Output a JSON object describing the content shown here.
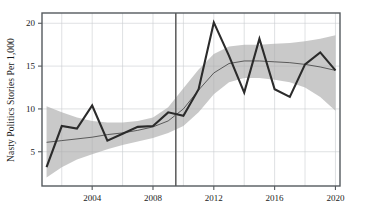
{
  "chart_data": {
    "type": "line",
    "title": "",
    "xlabel": "",
    "ylabel": "Nasty Politics Stories Per 1,000",
    "xlim": [
      2000.7,
      2020.3
    ],
    "ylim": [
      1.0,
      21.2
    ],
    "grid": true,
    "legend": "none",
    "x_ticks": [
      2004,
      2008,
      2012,
      2016,
      2020
    ],
    "x_tick_labels": [
      "2004",
      "2008",
      "2012",
      "2016",
      "2020"
    ],
    "y_ticks": [
      5,
      10,
      15,
      20
    ],
    "y_tick_labels": [
      "5",
      "10",
      "15",
      "20"
    ],
    "x_gridlines": [
      2002,
      2004,
      2006,
      2008,
      2010,
      2012,
      2014,
      2016,
      2018,
      2020
    ],
    "y_gridlines": [
      5,
      10,
      15,
      20
    ],
    "annotations": [
      {
        "name": "vertical-reference-line",
        "type": "vline",
        "x": 2009.5
      }
    ],
    "x": [
      2001,
      2002,
      2003,
      2004,
      2005,
      2006,
      2007,
      2008,
      2009,
      2010,
      2011,
      2012,
      2013,
      2014,
      2015,
      2016,
      2017,
      2018,
      2019,
      2020
    ],
    "series": [
      {
        "name": "Nasty Politics Stories Per 1,000",
        "style": "observed-line",
        "color": "#2b2b2b",
        "values": [
          3.2,
          8.0,
          7.7,
          10.4,
          6.3,
          7.1,
          7.9,
          8.0,
          9.6,
          9.2,
          12.3,
          20.1,
          16.2,
          11.9,
          18.2,
          12.3,
          11.4,
          15.2,
          16.6,
          14.5
        ]
      },
      {
        "name": "Smoothed trend",
        "style": "trend-line",
        "color": "#3d3d3d",
        "values": [
          6.1,
          6.3,
          6.5,
          6.7,
          7.0,
          7.2,
          7.5,
          7.9,
          8.6,
          10.0,
          12.2,
          14.2,
          15.3,
          15.6,
          15.6,
          15.5,
          15.4,
          15.2,
          14.9,
          14.5
        ]
      }
    ],
    "confidence_band": {
      "name": "confidence-interval",
      "color": "#a8a8a8",
      "opacity": 0.62,
      "upper": [
        10.3,
        9.6,
        9.0,
        8.6,
        8.4,
        8.4,
        8.6,
        9.0,
        10.2,
        12.4,
        14.6,
        16.4,
        17.3,
        17.5,
        17.5,
        17.6,
        17.7,
        17.9,
        18.2,
        18.6
      ],
      "lower": [
        2.0,
        3.2,
        4.1,
        4.7,
        5.3,
        5.8,
        6.2,
        6.6,
        7.2,
        8.0,
        9.6,
        11.7,
        13.1,
        13.6,
        13.6,
        13.4,
        13.1,
        12.5,
        11.4,
        9.8
      ]
    }
  }
}
